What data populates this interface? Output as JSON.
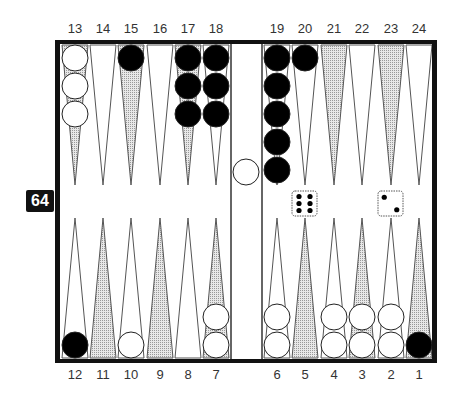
{
  "top_labels": [
    "13",
    "14",
    "15",
    "16",
    "17",
    "18",
    "19",
    "20",
    "21",
    "22",
    "23",
    "24"
  ],
  "bottom_labels": [
    "12",
    "11",
    "10",
    "9",
    "8",
    "7",
    "6",
    "5",
    "4",
    "3",
    "2",
    "1"
  ],
  "cube": {
    "value": "64"
  },
  "dice": [
    6,
    2
  ],
  "colors": {
    "black_checker": "#000000",
    "white_checker": "#ffffff",
    "shaded_point": "#c8c8c8",
    "frame": "#111111"
  },
  "checkers": {
    "black": {
      "15": 1,
      "17": 3,
      "18": 3,
      "19": 5,
      "20": 1,
      "12": 1,
      "1": 1
    },
    "white": {
      "13": 3,
      "bar": 1,
      "10": 1,
      "7": 2,
      "6": 2,
      "4": 2,
      "3": 2,
      "2": 2
    }
  }
}
